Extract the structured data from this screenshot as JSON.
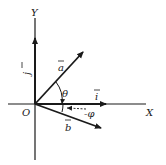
{
  "diagram": {
    "type": "vector-diagram",
    "colors": {
      "ink": "#1a1a1a",
      "background": "#ffffff"
    },
    "axes": {
      "x_label": "X",
      "y_label": "Y",
      "origin_label": "O"
    },
    "vectors": [
      {
        "id": "j",
        "label": "j",
        "description": "unit vector along Y axis"
      },
      {
        "id": "i",
        "label": "i",
        "description": "unit vector along X axis"
      },
      {
        "id": "a",
        "label": "a",
        "description": "vector a at angle theta above X axis"
      },
      {
        "id": "b",
        "label": "b",
        "description": "vector b at angle phi below X axis"
      }
    ],
    "angles": [
      {
        "id": "theta",
        "label": "θ",
        "between": [
          "a",
          "X"
        ]
      },
      {
        "id": "phi",
        "label": "-φ",
        "between": [
          "b",
          "X"
        ]
      }
    ]
  }
}
